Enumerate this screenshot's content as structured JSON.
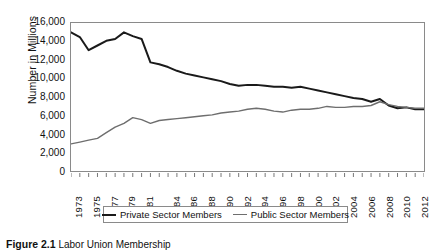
{
  "figure": {
    "caption_number": "Figure 2.1",
    "caption_text": "Labor Union Membership"
  },
  "chart_data": {
    "type": "line",
    "title": "",
    "subtitle": "",
    "xlabel": "",
    "ylabel": "Number in Millions",
    "ylim": [
      0,
      16000
    ],
    "ytick_values": [
      0,
      2000,
      4000,
      6000,
      8000,
      10000,
      12000,
      14000,
      16000
    ],
    "ytick_labels": [
      "0",
      "2,000",
      "4,000",
      "6,000",
      "8,000",
      "10,000",
      "12,000",
      "14,000",
      "16,000"
    ],
    "xlim": [
      1973,
      2013
    ],
    "x": [
      1973,
      1974,
      1975,
      1976,
      1977,
      1978,
      1979,
      1980,
      1981,
      1982,
      1983,
      1984,
      1985,
      1986,
      1987,
      1988,
      1989,
      1990,
      1991,
      1992,
      1993,
      1994,
      1995,
      1996,
      1997,
      1998,
      1999,
      2000,
      2001,
      2002,
      2003,
      2004,
      2005,
      2006,
      2007,
      2008,
      2009,
      2010,
      2011,
      2012,
      2013
    ],
    "xtick_labels": [
      "1973",
      "1975",
      "1977",
      "1979",
      "1981",
      "1984",
      "1986",
      "1988",
      "1990",
      "1992",
      "1994",
      "1996",
      "1998",
      "2000",
      "2002",
      "2004",
      "2006",
      "2008",
      "2010",
      "2012"
    ],
    "grid": false,
    "legend_position": "bottom",
    "series": [
      {
        "name": "Private Sector Members",
        "color": "#1a1a1a",
        "line_width": 2,
        "values": [
          15000,
          14500,
          13100,
          13600,
          14100,
          14300,
          15000,
          14600,
          14300,
          11800,
          11600,
          11300,
          10900,
          10600,
          10400,
          10200,
          10000,
          9800,
          9500,
          9300,
          9400,
          9400,
          9300,
          9200,
          9200,
          9100,
          9200,
          9000,
          8800,
          8600,
          8400,
          8200,
          8000,
          7900,
          7600,
          7900,
          7200,
          6900,
          7000,
          6800,
          6800
        ]
      },
      {
        "name": "Public Sector Members",
        "color": "#6e6e6e",
        "line_width": 1.4,
        "values": [
          3100,
          3300,
          3500,
          3700,
          4300,
          4900,
          5300,
          5900,
          5700,
          5300,
          5600,
          5700,
          5800,
          5900,
          6000,
          6100,
          6200,
          6400,
          6500,
          6600,
          6800,
          6900,
          6800,
          6600,
          6500,
          6700,
          6800,
          6800,
          6900,
          7100,
          7000,
          7000,
          7100,
          7100,
          7200,
          7600,
          7300,
          7100,
          7000,
          6900,
          6900
        ]
      }
    ]
  },
  "legend": {
    "entries": [
      {
        "label": "Private Sector Members"
      },
      {
        "label": "Public Sector Members"
      }
    ]
  }
}
